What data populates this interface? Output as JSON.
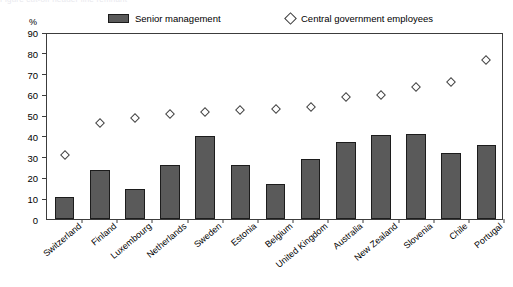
{
  "ghost_text": "Figure cut-off header line remnant",
  "unit_label": "%",
  "legend": {
    "bars_label": "Senior management",
    "markers_label": "Central government employees"
  },
  "chart_data": {
    "type": "bar",
    "title": "",
    "subtitle": "",
    "xlabel": "",
    "ylabel": "%",
    "ylim": [
      0,
      90
    ],
    "yticks": [
      0,
      10,
      20,
      30,
      40,
      50,
      60,
      70,
      80,
      90
    ],
    "grid": false,
    "legend_position": "top",
    "categories": [
      "Switzerland",
      "Finland",
      "Luxembourg",
      "Netherlands",
      "Sweden",
      "Estonia",
      "Belgium",
      "United Kingdom",
      "Australia",
      "New Zealand",
      "Slovenia",
      "Chile",
      "Portugal"
    ],
    "series": [
      {
        "name": "Senior management",
        "type": "bar",
        "color": "#5a5a5a",
        "values": [
          10.5,
          23.5,
          14.5,
          26,
          40,
          26,
          17,
          29,
          37,
          40.5,
          41,
          32,
          35.5
        ]
      },
      {
        "name": "Central government employees",
        "type": "scatter",
        "marker": "diamond-open",
        "color": "#444444",
        "values": [
          31,
          46,
          48.5,
          50.5,
          51.5,
          52.5,
          53,
          54,
          58.5,
          59.5,
          63.5,
          66,
          76.5
        ]
      }
    ]
  }
}
